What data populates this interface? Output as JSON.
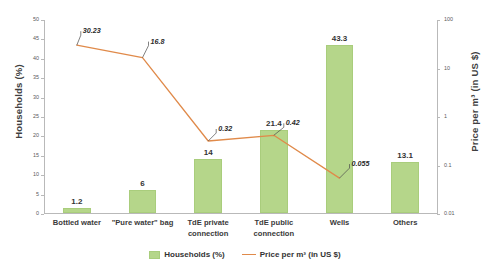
{
  "chart_data": {
    "type": "bar",
    "title": "",
    "subtitle": "",
    "xlabel": "",
    "ylabel": "Households (%)",
    "y2label": "Price per m³ (in US $)",
    "grid": false,
    "legend_position": "bottom",
    "categories": [
      "Bottled water",
      "\"Pure water\" bag",
      "TdE private connection",
      "TdE public connection",
      "Wells",
      "Others"
    ],
    "category_lines": [
      [
        "Bottled water"
      ],
      [
        "\"Pure water\" bag"
      ],
      [
        "TdE private",
        "connection"
      ],
      [
        "TdE public",
        "connection"
      ],
      [
        "Wells"
      ],
      [
        "Others"
      ]
    ],
    "ylim": [
      0,
      50
    ],
    "yticks": [
      "0",
      "5",
      "10",
      "15",
      "20",
      "25",
      "30",
      "35",
      "40",
      "45",
      "50"
    ],
    "y2lim": [
      0.01,
      100
    ],
    "y2scale": "log",
    "y2ticks": [
      "0.01",
      "0.1",
      "1",
      "10",
      "100"
    ],
    "series": [
      {
        "name": "Households (%)",
        "type": "bar",
        "axis": "left",
        "color": "#b5d68a",
        "values": [
          1.2,
          6,
          14,
          21.4,
          43.3,
          13.1
        ],
        "labels": [
          "1.2",
          "6",
          "14",
          "21.4",
          "43.3",
          "13.1"
        ]
      },
      {
        "name": "Price per m³ (in US $)",
        "type": "line",
        "axis": "right",
        "color": "#e08a4a",
        "values": [
          30.23,
          16.8,
          0.32,
          0.42,
          0.055,
          null
        ],
        "labels": [
          "30.23",
          "16.8",
          "0.32",
          "0.42",
          "0.055",
          null
        ]
      }
    ]
  },
  "legend": {
    "bar_label": "Households (%)",
    "line_label": "Price per m³ (in US $)"
  },
  "axes": {
    "left_title": "Households (%)",
    "right_title": "Price per m³ (in US $)"
  }
}
